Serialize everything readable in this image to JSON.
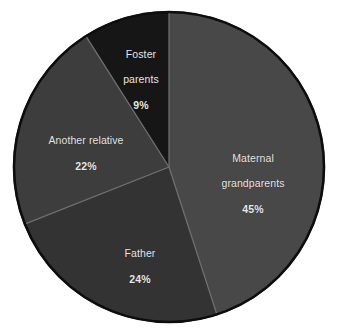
{
  "chart_data": {
    "type": "pie",
    "title": "",
    "subtitle": "",
    "xlabel": "",
    "ylabel": "",
    "legend_position": "none",
    "grid": false,
    "label_format": "name and percent inside slice",
    "start_angle_deg": 0,
    "direction": "clockwise",
    "unit": "%",
    "categories": [
      "Maternal grandparents",
      "Father",
      "Another relative",
      "Foster parents"
    ],
    "values": [
      45,
      24,
      22,
      9
    ],
    "slices": [
      {
        "label": "Maternal\ngrandparents",
        "label_line1": "Maternal",
        "label_line2": "grandparents",
        "value": 45,
        "value_text": "45%",
        "color": "#484848"
      },
      {
        "label": "Father",
        "label_line1": "Father",
        "label_line2": "",
        "value": 24,
        "value_text": "24%",
        "color": "#333333"
      },
      {
        "label": "Another relative",
        "label_line1": "Another relative",
        "label_line2": "",
        "value": 22,
        "value_text": "22%",
        "color": "#3d3d3d"
      },
      {
        "label": "Foster\nparents",
        "label_line1": "Foster",
        "label_line2": "parents",
        "value": 9,
        "value_text": "9%",
        "color": "#161616"
      }
    ]
  },
  "style": {
    "background": "#ffffff",
    "outline_color": "#0d0d0d",
    "divider_color": "#6e6e6e",
    "label_color": "#e8e8e8"
  },
  "geometry": {
    "center_x": 169,
    "center_y": 167,
    "radius": 156
  }
}
